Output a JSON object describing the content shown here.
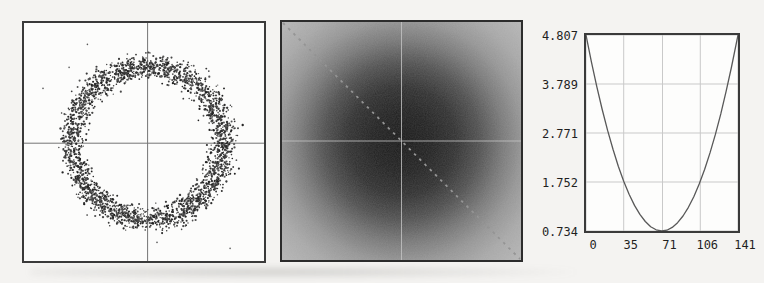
{
  "figure": {
    "background_color": "#f4f3f1"
  },
  "chart_data": [
    {
      "id": "ring-scatter",
      "type": "scatter",
      "title": "",
      "description": "Dense noisy ring of points centered in a square frame; thin crosshair reference lines cross at the ring center",
      "n_points": 2600,
      "dust_specks": 9,
      "ring_center_fraction": [
        0.515,
        0.505
      ],
      "ring_mean_radius_px": 76,
      "ring_radius_sigma_px": 6.2,
      "point_color": "#2e2e2e",
      "background": "#fcfcfb",
      "frame_color": "#3a3a3a",
      "crosshair_color": "#747474",
      "grid": false,
      "axis_labels": "none"
    },
    {
      "id": "grayscale-image",
      "type": "heatmap",
      "title": "",
      "description": "Grainy grayscale intensity image: dark Gaussian-like blob at center fading to light gray corners; light dashed main diagonal from top-left to bottom-right; faint light crosshair through center",
      "gradient_center_color": "#181818",
      "gradient_corner_color": "#b6b6b6",
      "gradient_stops": [
        [
          0,
          "#181818"
        ],
        [
          0.18,
          "#212121"
        ],
        [
          0.32,
          "#303030"
        ],
        [
          0.46,
          "#4f4f4f"
        ],
        [
          0.6,
          "#787878"
        ],
        [
          0.72,
          "#959595"
        ],
        [
          0.84,
          "#a8a8a8"
        ],
        [
          1,
          "#b6b6b6"
        ]
      ],
      "diagonal": {
        "from": "top-left",
        "to": "bottom-right",
        "style": "dashed",
        "color": "#8f8f8f"
      },
      "crosshair_color": "#c4c4c4",
      "frame_color": "#2c2c2c",
      "grain": true
    },
    {
      "id": "error-curve",
      "type": "line",
      "title": "",
      "xlabel": "",
      "ylabel": "",
      "x_range": [
        0,
        141
      ],
      "y_range": [
        0.734,
        4.807
      ],
      "x_ticks": [
        0,
        35,
        71,
        106,
        141
      ],
      "x_tick_labels": [
        "0",
        "35",
        "71",
        "106",
        "141"
      ],
      "y_ticks": [
        4.807,
        3.789,
        2.771,
        1.752,
        0.734
      ],
      "y_tick_labels": [
        "4.807",
        "3.789",
        "2.771",
        "1.752",
        "0.734"
      ],
      "grid": true,
      "legend": "none",
      "vertex": {
        "x": 70.5,
        "y": 0.734
      },
      "series": [
        {
          "name": "error",
          "x": [
            0,
            5,
            10,
            15,
            20,
            25,
            30,
            35,
            40,
            45,
            50,
            55,
            60,
            65,
            70,
            75,
            80,
            85,
            90,
            95,
            100,
            105,
            110,
            115,
            120,
            125,
            130,
            135,
            141
          ],
          "y": [
            4.807,
            4.25,
            3.734,
            3.258,
            2.824,
            2.431,
            2.078,
            1.767,
            1.496,
            1.267,
            1.078,
            0.931,
            0.824,
            0.759,
            0.734,
            0.751,
            0.808,
            0.906,
            1.046,
            1.226,
            1.447,
            1.709,
            2.013,
            2.357,
            2.742,
            3.168,
            3.635,
            4.143,
            4.807
          ]
        }
      ],
      "line_color": "#585858",
      "grid_color": "#c9c9c9",
      "frame_color": "#3a3a3a",
      "label_color": "#1f1f1f"
    }
  ]
}
